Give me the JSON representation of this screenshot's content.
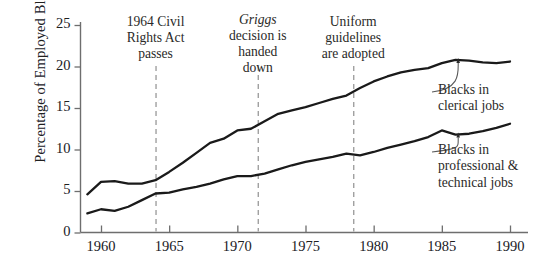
{
  "chart_data": {
    "type": "line",
    "title": "",
    "subtitle": "",
    "xlabel": "",
    "ylabel": "Percentage of Employed Blacks",
    "xlim": [
      1959,
      1990
    ],
    "ylim": [
      0,
      25
    ],
    "xticks": [
      1960,
      1965,
      1970,
      1975,
      1980,
      1985,
      1990
    ],
    "xtick_labels": [
      "1960",
      "1965",
      "1970",
      "1975",
      "1980",
      "1985",
      "1990"
    ],
    "yticks": [
      0,
      5,
      10,
      15,
      20,
      25
    ],
    "ytick_labels": [
      "0",
      "5",
      "10",
      "15",
      "20",
      "25"
    ],
    "grid": false,
    "legend_position": "inline-right-callouts",
    "x": [
      1959,
      1960,
      1961,
      1962,
      1963,
      1964,
      1965,
      1966,
      1967,
      1968,
      1969,
      1970,
      1971,
      1972,
      1973,
      1974,
      1975,
      1976,
      1977,
      1978,
      1979,
      1980,
      1981,
      1982,
      1983,
      1984,
      1985,
      1986,
      1987,
      1988,
      1989,
      1990
    ],
    "series": [
      {
        "name": "Blacks in clerical jobs",
        "label_lines": [
          "Blacks in",
          "clerical jobs"
        ],
        "values": [
          4.6,
          6.1,
          6.2,
          5.9,
          5.9,
          6.3,
          7.3,
          8.4,
          9.6,
          10.8,
          11.3,
          12.3,
          12.5,
          13.4,
          14.3,
          14.7,
          15.1,
          15.6,
          16.1,
          16.5,
          17.4,
          18.2,
          18.8,
          19.3,
          19.6,
          19.8,
          20.4,
          20.8,
          20.7,
          20.5,
          20.4,
          20.6
        ]
      },
      {
        "name": "Blacks in professional & technical jobs",
        "label_lines": [
          "Blacks in",
          "professional &",
          "technical jobs"
        ],
        "values": [
          2.3,
          2.8,
          2.6,
          3.1,
          3.9,
          4.7,
          4.8,
          5.2,
          5.5,
          5.9,
          6.4,
          6.8,
          6.8,
          7.1,
          7.6,
          8.1,
          8.5,
          8.8,
          9.1,
          9.5,
          9.3,
          9.7,
          10.2,
          10.6,
          11.0,
          11.5,
          12.3,
          11.8,
          11.9,
          12.2,
          12.6,
          13.1
        ]
      }
    ],
    "annotations": [
      {
        "id": "civil-rights-act",
        "lines": [
          "1964 Civil",
          "Rights Act",
          "passes"
        ],
        "italic_word": "",
        "x": 1964,
        "marker": "dashed-vertical-line"
      },
      {
        "id": "griggs-decision",
        "lines": [
          "Griggs",
          "decision is",
          "handed",
          "down"
        ],
        "italic_word": "Griggs",
        "x": 1971.5,
        "marker": "dashed-vertical-line"
      },
      {
        "id": "uniform-guidelines",
        "lines": [
          "Uniform",
          "guidelines",
          "are adopted"
        ],
        "italic_word": "",
        "x": 1978.5,
        "marker": "dashed-vertical-line"
      }
    ],
    "colors": {
      "line": "#1a1a1a",
      "axis": "#6e6e6e",
      "dashed": "#a0a0a0",
      "text": "#20201f",
      "background": "#ffffff"
    }
  }
}
